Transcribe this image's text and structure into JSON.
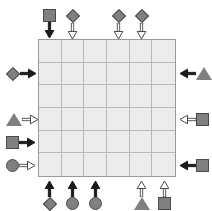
{
  "board": {
    "name": "logic-grid-puzzle",
    "columns": 6,
    "rows": 6,
    "cell_fill": "#ececec",
    "grid_line_color": "#b9b9b9",
    "border_color": "#9a9a9a"
  },
  "legend": {
    "shape_fill": "#808080",
    "shape_outline": "#4a4a4a",
    "arrow_filled_color": "#1a1a1a",
    "arrow_hollow_fill": "#ffffff",
    "arrow_hollow_outline": "#4a4a4a"
  },
  "clues": {
    "top": [
      {
        "index": 1,
        "column": 1,
        "shape": "square",
        "shape_name": "square-shape",
        "arrow": "filled",
        "arrow_name": "arrow-down-filled-icon",
        "direction": "down"
      },
      {
        "index": 2,
        "column": 2,
        "shape": "diamond",
        "shape_name": "diamond-shape",
        "arrow": "hollow",
        "arrow_name": "arrow-down-hollow-icon",
        "direction": "down"
      },
      {
        "index": 3,
        "column": 4,
        "shape": "diamond",
        "shape_name": "diamond-shape",
        "arrow": "hollow",
        "arrow_name": "arrow-down-hollow-icon",
        "direction": "down"
      },
      {
        "index": 4,
        "column": 5,
        "shape": "diamond",
        "shape_name": "diamond-shape",
        "arrow": "hollow",
        "arrow_name": "arrow-down-hollow-icon",
        "direction": "down"
      }
    ],
    "left": [
      {
        "index": 1,
        "row": 2,
        "shape": "diamond",
        "shape_name": "diamond-shape",
        "arrow": "filled",
        "arrow_name": "arrow-right-filled-icon",
        "direction": "right"
      },
      {
        "index": 2,
        "row": 4,
        "shape": "triangle",
        "shape_name": "triangle-shape",
        "arrow": "hollow",
        "arrow_name": "arrow-right-hollow-icon",
        "direction": "right"
      },
      {
        "index": 3,
        "row": 5,
        "shape": "square",
        "shape_name": "square-shape",
        "arrow": "filled",
        "arrow_name": "arrow-right-filled-icon",
        "direction": "right"
      },
      {
        "index": 4,
        "row": 6,
        "shape": "circle",
        "shape_name": "circle-shape",
        "arrow": "hollow",
        "arrow_name": "arrow-right-hollow-icon",
        "direction": "right"
      }
    ],
    "right": [
      {
        "index": 1,
        "row": 2,
        "shape": "triangle",
        "shape_name": "triangle-shape",
        "arrow": "filled",
        "arrow_name": "arrow-left-filled-icon",
        "direction": "left"
      },
      {
        "index": 2,
        "row": 4,
        "shape": "square",
        "shape_name": "square-shape",
        "arrow": "hollow",
        "arrow_name": "arrow-left-hollow-icon",
        "direction": "left"
      },
      {
        "index": 3,
        "row": 6,
        "shape": "square",
        "shape_name": "square-shape",
        "arrow": "filled",
        "arrow_name": "arrow-left-filled-icon",
        "direction": "left"
      }
    ],
    "bottom": [
      {
        "index": 1,
        "column": 1,
        "shape": "diamond",
        "shape_name": "diamond-shape",
        "arrow": "filled",
        "arrow_name": "arrow-up-filled-icon",
        "direction": "up"
      },
      {
        "index": 2,
        "column": 2,
        "shape": "circle",
        "shape_name": "circle-shape",
        "arrow": "filled",
        "arrow_name": "arrow-up-filled-icon",
        "direction": "up"
      },
      {
        "index": 3,
        "column": 3,
        "shape": "circle",
        "shape_name": "circle-shape",
        "arrow": "filled",
        "arrow_name": "arrow-up-filled-icon",
        "direction": "up"
      },
      {
        "index": 4,
        "column": 5,
        "shape": "triangle",
        "shape_name": "triangle-shape",
        "arrow": "hollow",
        "arrow_name": "arrow-up-hollow-icon",
        "direction": "up"
      },
      {
        "index": 5,
        "column": 6,
        "shape": "square",
        "shape_name": "square-shape",
        "arrow": "hollow",
        "arrow_name": "arrow-up-hollow-icon",
        "direction": "up"
      }
    ]
  },
  "cells": [
    [
      "",
      "",
      "",
      "",
      "",
      ""
    ],
    [
      "",
      "",
      "",
      "",
      "",
      ""
    ],
    [
      "",
      "",
      "",
      "",
      "",
      ""
    ],
    [
      "",
      "",
      "",
      "",
      "",
      ""
    ],
    [
      "",
      "",
      "",
      "",
      "",
      ""
    ],
    [
      "",
      "",
      "",
      "",
      "",
      ""
    ]
  ]
}
